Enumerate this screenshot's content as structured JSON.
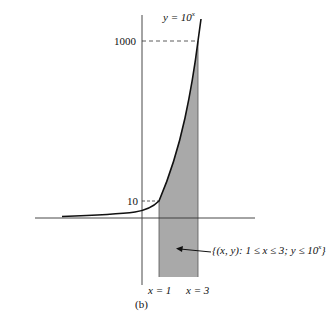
{
  "figure": {
    "caption": "(b)",
    "curve_label_prefix": "y = 10",
    "curve_label_exp": "x",
    "tick_1000": "1000",
    "tick_10": "10",
    "x1_label": "x = 1",
    "x3_label": "x = 3",
    "region_label_main": "{(x, y): 1 ≤ x ≤ 3; y ≤ 10",
    "region_label_exp": "x",
    "region_label_close": "}",
    "colors": {
      "shade": "#a9a9a9",
      "line": "#111111",
      "axis": "#333333"
    }
  }
}
